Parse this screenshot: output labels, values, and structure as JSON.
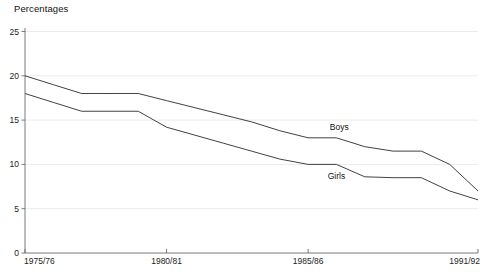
{
  "chart_data": {
    "type": "line",
    "title": "Percentages",
    "xlabel": "",
    "ylabel": "",
    "ylim": [
      0,
      25
    ],
    "yticks": [
      0,
      5,
      10,
      15,
      20,
      25
    ],
    "ytick_labels": [
      "0",
      "5",
      "10",
      "15",
      "20",
      "25"
    ],
    "grid": true,
    "legend_position": "inline-on-series",
    "x": [
      "1975/76",
      "1976/77",
      "1977/78",
      "1978/79",
      "1979/80",
      "1980/81",
      "1981/82",
      "1982/83",
      "1983/84",
      "1984/85",
      "1985/86",
      "1986/87",
      "1987/88",
      "1988/89",
      "1989/90",
      "1990/91",
      "1991/92"
    ],
    "xtick_labels": [
      "1975/76",
      "1980/81",
      "1985/86",
      "1991/92"
    ],
    "xtick_positions": [
      0,
      5,
      10,
      16
    ],
    "series": [
      {
        "name": "Boys",
        "values": [
          20,
          19,
          18,
          18,
          18,
          17.2,
          16.4,
          15.6,
          14.8,
          13.8,
          13,
          13,
          12,
          11.5,
          11.5,
          10,
          7
        ]
      },
      {
        "name": "Girls",
        "values": [
          18,
          17,
          16,
          16,
          16,
          14.2,
          13.3,
          12.4,
          11.5,
          10.6,
          10,
          10,
          8.6,
          8.5,
          8.5,
          7,
          6
        ]
      }
    ],
    "annotations": [
      {
        "text": "Boys",
        "x_index": 11.1,
        "y_value": 13.9
      },
      {
        "text": "Girls",
        "x_index": 11.0,
        "y_value": 8.3
      }
    ]
  },
  "caption": {
    "sliver_text": " "
  }
}
